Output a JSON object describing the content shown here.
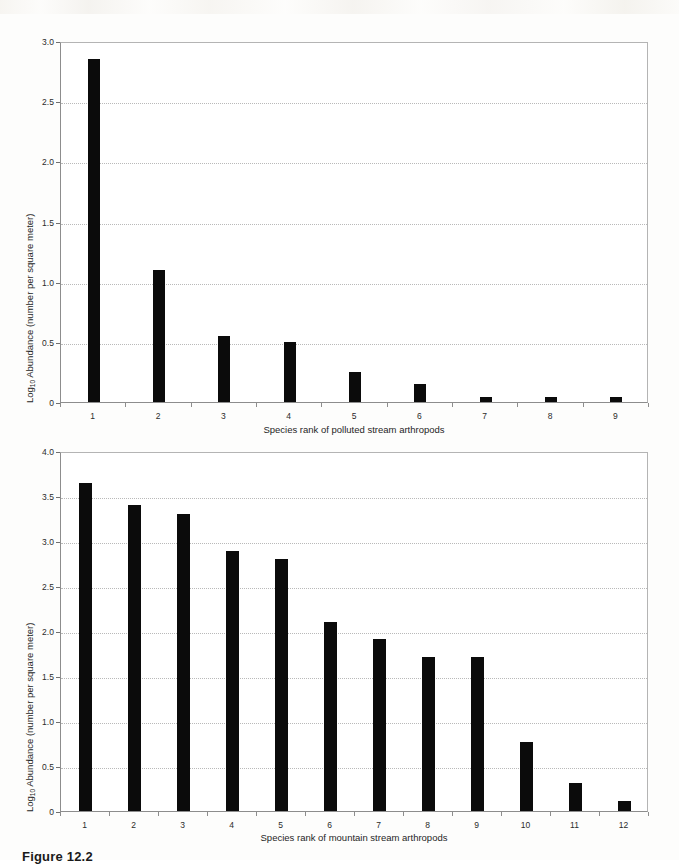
{
  "figure": {
    "caption": "Figure 12.2"
  },
  "chart_data": [
    {
      "id": "polluted-stream",
      "type": "bar",
      "title": "",
      "xlabel": "Species rank of polluted stream arthropods",
      "ylabel": "Log10 Abundance (number per square meter)",
      "ylabel_prefix": "Log",
      "ylabel_sub": "10",
      "ylabel_suffix": " Abundance (number per square meter)",
      "categories": [
        "1",
        "2",
        "3",
        "4",
        "5",
        "6",
        "7",
        "8",
        "9"
      ],
      "values": [
        2.85,
        1.1,
        0.55,
        0.5,
        0.25,
        0.15,
        0.04,
        0.04,
        0.04
      ],
      "ylim": [
        0,
        3.0
      ],
      "yticks": [
        0,
        0.5,
        1.0,
        1.5,
        2.0,
        2.5,
        3.0
      ],
      "ytick_labels": [
        "0",
        "0.5",
        "1.0",
        "1.5",
        "2.0",
        "2.5",
        "3.0"
      ],
      "grid": true,
      "grid_axis": "y",
      "legend": "none",
      "bar_color": "#0b0b0b"
    },
    {
      "id": "mountain-stream",
      "type": "bar",
      "title": "",
      "xlabel": "Species rank of mountain stream arthropods",
      "ylabel": "Log10 Abundance (number per square meter)",
      "ylabel_prefix": "Log",
      "ylabel_sub": "10",
      "ylabel_suffix": " Abundance (number per square meter)",
      "categories": [
        "1",
        "2",
        "3",
        "4",
        "5",
        "6",
        "7",
        "8",
        "9",
        "10",
        "11",
        "12"
      ],
      "values": [
        3.65,
        3.4,
        3.3,
        2.89,
        2.8,
        2.1,
        1.91,
        1.71,
        1.71,
        0.77,
        0.31,
        0.11
      ],
      "ylim": [
        0,
        4.0
      ],
      "yticks": [
        0,
        0.5,
        1.0,
        1.5,
        2.0,
        2.5,
        3.0,
        3.5,
        4.0
      ],
      "ytick_labels": [
        "0",
        "0.5",
        "1.0",
        "1.5",
        "2.0",
        "2.5",
        "3.0",
        "3.5",
        "4.0"
      ],
      "grid": true,
      "grid_axis": "y",
      "legend": "none",
      "bar_color": "#0b0b0b"
    }
  ]
}
